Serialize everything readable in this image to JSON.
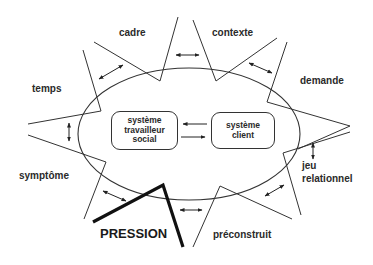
{
  "labels": {
    "cadre": "cadre",
    "contexte": "contexte",
    "temps": "temps",
    "demande": "demande",
    "symptome": "symptôme",
    "jeu": "jeu",
    "relationnel": "relationnel",
    "pression": "PRESSION",
    "preconstruit": "préconstruit"
  },
  "boxes": {
    "travailleur": [
      "système",
      "travailleur",
      "social"
    ],
    "client": [
      "système",
      "client"
    ]
  },
  "colors": {
    "line": "#333333",
    "text": "#2a2a2a",
    "background": "#ffffff"
  }
}
